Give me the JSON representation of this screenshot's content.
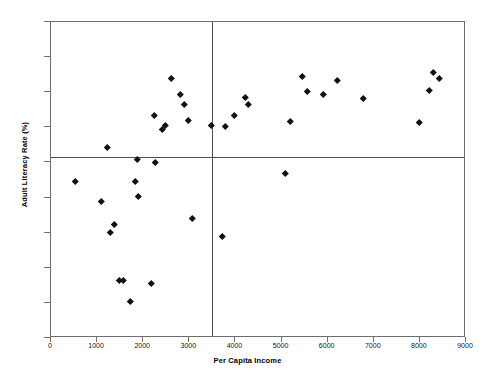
{
  "chart_data": {
    "type": "scatter",
    "title": "",
    "xlabel": "Per Capita Income",
    "ylabel": "Adult Literacy Rate (%)",
    "xlim": [
      0,
      9000
    ],
    "ylim": [
      20,
      110
    ],
    "xticks": [
      0,
      1000,
      2000,
      3000,
      4000,
      5000,
      6000,
      7000,
      8000,
      9000
    ],
    "yticks": [
      20,
      30,
      40,
      50,
      60,
      70,
      80,
      90,
      100,
      110
    ],
    "grid": false,
    "legend": null,
    "reference_lines": {
      "horizontal": 71.5,
      "vertical": 3500
    },
    "marker": "diamond",
    "marker_color": "#111111",
    "points": [
      {
        "x": 520,
        "y": 64.5
      },
      {
        "x": 1080,
        "y": 58.8
      },
      {
        "x": 1230,
        "y": 74.3
      },
      {
        "x": 1280,
        "y": 50.0
      },
      {
        "x": 1380,
        "y": 52.3
      },
      {
        "x": 1480,
        "y": 36.4
      },
      {
        "x": 1560,
        "y": 36.4
      },
      {
        "x": 1720,
        "y": 30.5
      },
      {
        "x": 1820,
        "y": 64.5
      },
      {
        "x": 1870,
        "y": 71.0
      },
      {
        "x": 1900,
        "y": 60.3
      },
      {
        "x": 2180,
        "y": 35.7
      },
      {
        "x": 2230,
        "y": 83.5
      },
      {
        "x": 2260,
        "y": 70.0
      },
      {
        "x": 2420,
        "y": 79.5
      },
      {
        "x": 2470,
        "y": 80.5
      },
      {
        "x": 2610,
        "y": 94.0
      },
      {
        "x": 2800,
        "y": 89.3
      },
      {
        "x": 2900,
        "y": 86.5
      },
      {
        "x": 2980,
        "y": 82.0
      },
      {
        "x": 3060,
        "y": 54.0
      },
      {
        "x": 3480,
        "y": 80.5
      },
      {
        "x": 3720,
        "y": 49.0
      },
      {
        "x": 3790,
        "y": 80.3
      },
      {
        "x": 3980,
        "y": 83.5
      },
      {
        "x": 4220,
        "y": 88.5
      },
      {
        "x": 4280,
        "y": 86.5
      },
      {
        "x": 5080,
        "y": 67.0
      },
      {
        "x": 5180,
        "y": 81.8
      },
      {
        "x": 5450,
        "y": 94.5
      },
      {
        "x": 5560,
        "y": 90.3
      },
      {
        "x": 5900,
        "y": 89.5
      },
      {
        "x": 6200,
        "y": 93.5
      },
      {
        "x": 6780,
        "y": 88.3
      },
      {
        "x": 7980,
        "y": 81.3
      },
      {
        "x": 8200,
        "y": 90.5
      },
      {
        "x": 8300,
        "y": 95.8
      },
      {
        "x": 8420,
        "y": 94.0
      }
    ]
  }
}
